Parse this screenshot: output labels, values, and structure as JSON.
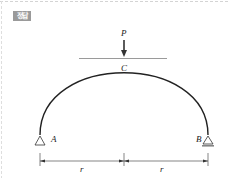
{
  "badge": {
    "label": "정답"
  },
  "diagram": {
    "type": "semicircular-arch",
    "load": {
      "label": "P",
      "point": "C",
      "direction": "down"
    },
    "points": {
      "top": {
        "label": "C"
      },
      "left_support": {
        "label": "A",
        "type": "pin"
      },
      "right_support": {
        "label": "B",
        "type": "roller"
      }
    },
    "dimensions": [
      {
        "label": "r",
        "span": "A to center"
      },
      {
        "label": "r",
        "span": "center to B"
      }
    ],
    "colors": {
      "stroke": "#222222",
      "badge_bg": "#9a9a9a",
      "tangent": "#555555"
    }
  }
}
